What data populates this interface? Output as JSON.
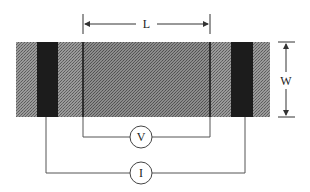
{
  "diagram": {
    "type": "four-point-probe-measurement",
    "labels": {
      "length": "L",
      "width": "W",
      "voltmeter": "V",
      "ammeter": "I"
    },
    "colors": {
      "sample_outer": "#8a8a8a",
      "sample_inner": "#7a7a7a",
      "contact": "#1c1c1c",
      "wire": "#555555",
      "background": "#ffffff"
    },
    "sample": {
      "x": 16,
      "y": 42,
      "width": 254,
      "height": 75
    },
    "current_contacts": [
      {
        "x": 37,
        "width": 21
      },
      {
        "x": 231,
        "width": 22
      }
    ],
    "voltage_probes": [
      {
        "x": 83
      },
      {
        "x": 210
      }
    ],
    "length_dimension": {
      "x1": 83,
      "x2": 210,
      "y": 24
    },
    "width_dimension": {
      "x": 286,
      "y1": 42,
      "y2": 117
    },
    "voltmeter": {
      "cx": 141,
      "cy": 137,
      "r": 11
    },
    "ammeter": {
      "cx": 141,
      "cy": 173,
      "r": 11
    }
  }
}
